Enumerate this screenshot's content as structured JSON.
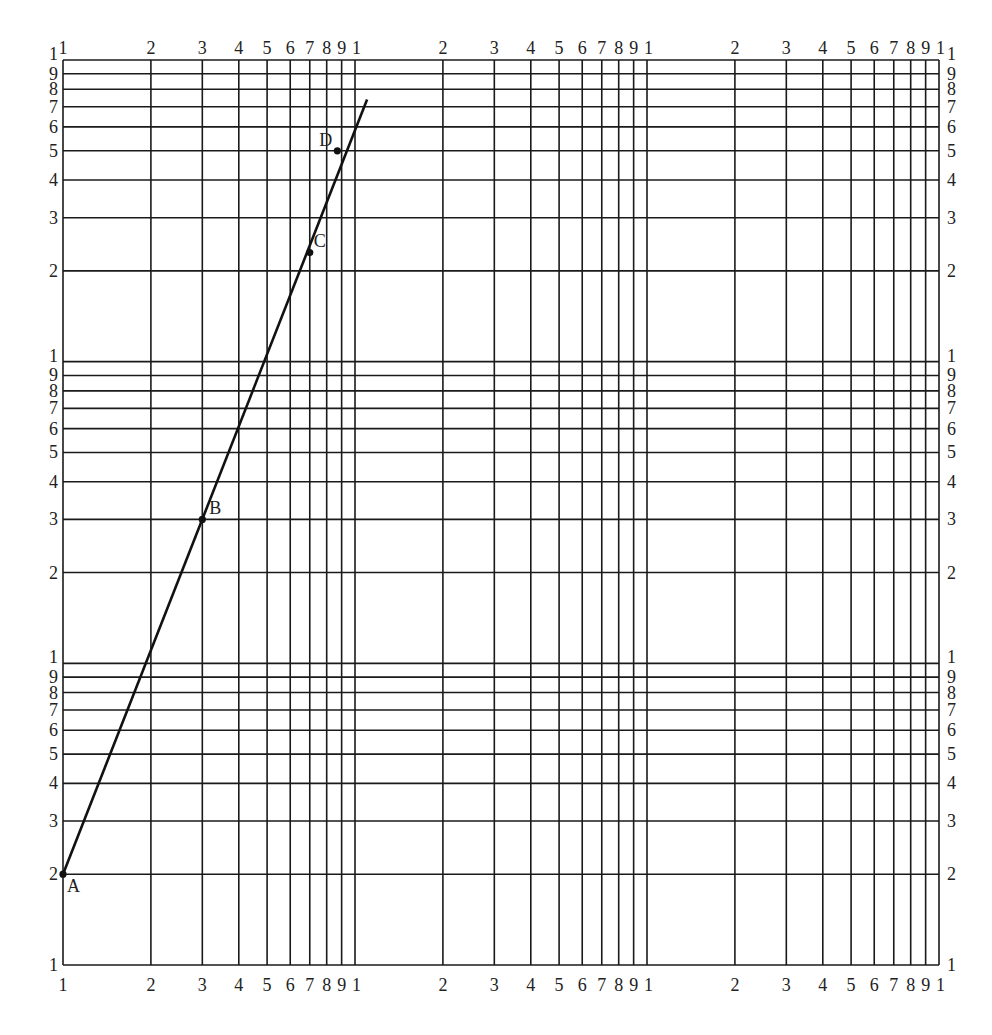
{
  "chart_data": {
    "type": "scatter",
    "title": "",
    "xlabel": "",
    "ylabel": "",
    "x_scale": "log",
    "y_scale": "log",
    "xlim": [
      1,
      1000
    ],
    "ylim": [
      1,
      1000
    ],
    "grid": true,
    "x_decades": 3,
    "y_decades": 3,
    "decade_tick_labels": [
      "1",
      "2",
      "3",
      "4",
      "5",
      "6",
      "7",
      "8",
      "9",
      "1"
    ],
    "points": [
      {
        "label": "A",
        "x": 1,
        "y": 2,
        "on_line": true
      },
      {
        "label": "B",
        "x": 3,
        "y": 30,
        "on_line": true
      },
      {
        "label": "C",
        "x": 7,
        "y": 230,
        "on_line": false
      },
      {
        "label": "D",
        "x": 8.7,
        "y": 500,
        "on_line": true
      }
    ],
    "line": {
      "description": "straight line on log-log paper through A, B and D",
      "start": {
        "x": 1,
        "y": 2
      },
      "end": {
        "x": 11,
        "y": 740
      }
    }
  },
  "colors": {
    "grid": "#1a1a1a",
    "line": "#111111",
    "background": "#ffffff"
  }
}
